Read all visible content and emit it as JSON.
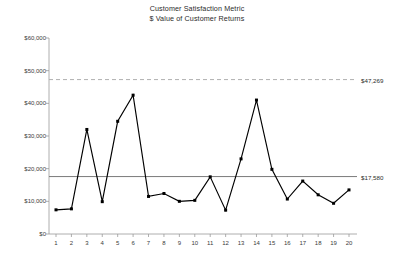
{
  "chart_data": {
    "type": "line",
    "title": "Customer Satisfaction Metric",
    "subtitle": "$ Value of Customer Returns",
    "xlabel": "",
    "ylabel": "",
    "grid": false,
    "legend": "none",
    "xlim": [
      1,
      20
    ],
    "ylim": [
      0,
      60000
    ],
    "y_ticks": [
      0,
      10000,
      20000,
      30000,
      40000,
      50000,
      60000
    ],
    "y_tick_labels": [
      "$0",
      "$10,000",
      "$20,000",
      "$30,000",
      "$40,000",
      "$50,000",
      "$60,000"
    ],
    "categories": [
      1,
      2,
      3,
      4,
      5,
      6,
      7,
      8,
      9,
      10,
      11,
      12,
      13,
      14,
      15,
      16,
      17,
      18,
      19,
      20
    ],
    "x_tick_labels": [
      "1",
      "2",
      "3",
      "4",
      "5",
      "6",
      "7",
      "8",
      "9",
      "10",
      "11",
      "12",
      "13",
      "14",
      "15",
      "16",
      "17",
      "18",
      "19",
      "20"
    ],
    "series": [
      {
        "name": "$ Value of Customer Returns",
        "values": [
          7400,
          7700,
          32000,
          9900,
          34500,
          42500,
          11500,
          12400,
          10000,
          10300,
          17500,
          7300,
          23000,
          41000,
          19800,
          10700,
          16200,
          12000,
          9400,
          13500
        ],
        "color": "#000000",
        "marker": "square"
      }
    ],
    "reference_lines": [
      {
        "name": "upper-control-limit",
        "value": 47269,
        "label": "$47,269",
        "style": "dashed",
        "color": "#b0b0b0"
      },
      {
        "name": "mean-line",
        "value": 17580,
        "label": "$17,580",
        "style": "solid",
        "color": "#7a7a7a"
      }
    ],
    "colors": {
      "series": "#000000",
      "axis": "#9a9a9a",
      "ucl": "#b0b0b0",
      "mean": "#7a7a7a",
      "text": "#2b2b2b",
      "background": "#ffffff"
    }
  }
}
